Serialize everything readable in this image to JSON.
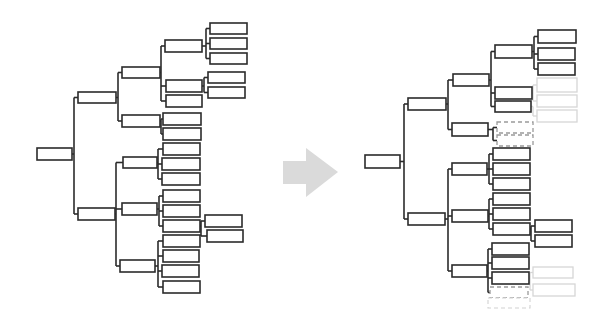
{
  "diagram": {
    "canvas": {
      "width": 614,
      "height": 332,
      "background": "#ffffff"
    },
    "styles": {
      "solid": {
        "stroke": "#2b2b2b",
        "width": 1.6,
        "dash": ""
      },
      "dashed": {
        "stroke": "#9a9a9a",
        "width": 1.3,
        "dash": "4 3"
      },
      "ghost": {
        "stroke": "#d6d6d6",
        "width": 1.3,
        "dash": ""
      },
      "ghost-dashed": {
        "stroke": "#d2d2d2",
        "width": 1.1,
        "dash": "4 3"
      }
    },
    "arrow": {
      "fill": "#dadada",
      "points": [
        [
          283,
          161
        ],
        [
          306,
          161
        ],
        [
          306,
          148
        ],
        [
          338,
          172
        ],
        [
          306,
          197
        ],
        [
          306,
          184
        ],
        [
          283,
          184
        ]
      ]
    },
    "trees": [
      {
        "id": "tree-before",
        "nodes": [
          {
            "id": "root",
            "x": 37,
            "y": 148,
            "w": 35,
            "h": 12,
            "style": "solid"
          },
          {
            "id": "u",
            "x": 78,
            "y": 92,
            "w": 38,
            "h": 11,
            "style": "solid"
          },
          {
            "id": "l",
            "x": 78,
            "y": 208,
            "w": 37,
            "h": 12,
            "style": "solid"
          },
          {
            "id": "a",
            "x": 122,
            "y": 67,
            "w": 38,
            "h": 11,
            "style": "solid"
          },
          {
            "id": "b",
            "x": 122,
            "y": 115,
            "w": 38,
            "h": 12,
            "style": "solid"
          },
          {
            "id": "c",
            "x": 123,
            "y": 157,
            "w": 34,
            "h": 11,
            "style": "solid"
          },
          {
            "id": "d",
            "x": 122,
            "y": 203,
            "w": 35,
            "h": 12,
            "style": "solid"
          },
          {
            "id": "e",
            "x": 120,
            "y": 260,
            "w": 35,
            "h": 12,
            "style": "solid"
          },
          {
            "id": "b1",
            "x": 165,
            "y": 40,
            "w": 37,
            "h": 12,
            "style": "solid"
          },
          {
            "id": "b2",
            "x": 166,
            "y": 80,
            "w": 36,
            "h": 12,
            "style": "solid"
          },
          {
            "id": "b3",
            "x": 166,
            "y": 95,
            "w": 36,
            "h": 12,
            "style": "solid"
          },
          {
            "id": "b4",
            "x": 163,
            "y": 113,
            "w": 38,
            "h": 12,
            "style": "solid"
          },
          {
            "id": "b5",
            "x": 163,
            "y": 128,
            "w": 38,
            "h": 12,
            "style": "solid"
          },
          {
            "id": "b6",
            "x": 163,
            "y": 143,
            "w": 37,
            "h": 12,
            "style": "solid"
          },
          {
            "id": "b7",
            "x": 162,
            "y": 158,
            "w": 38,
            "h": 12,
            "style": "solid"
          },
          {
            "id": "b8",
            "x": 162,
            "y": 173,
            "w": 38,
            "h": 12,
            "style": "solid"
          },
          {
            "id": "b9",
            "x": 163,
            "y": 190,
            "w": 37,
            "h": 12,
            "style": "solid"
          },
          {
            "id": "b10",
            "x": 163,
            "y": 205,
            "w": 37,
            "h": 12,
            "style": "solid"
          },
          {
            "id": "b11",
            "x": 163,
            "y": 220,
            "w": 37,
            "h": 12,
            "style": "solid"
          },
          {
            "id": "b12",
            "x": 163,
            "y": 235,
            "w": 37,
            "h": 12,
            "style": "solid"
          },
          {
            "id": "b13",
            "x": 163,
            "y": 250,
            "w": 36,
            "h": 12,
            "style": "solid"
          },
          {
            "id": "b14",
            "x": 162,
            "y": 265,
            "w": 37,
            "h": 12,
            "style": "solid"
          },
          {
            "id": "b15",
            "x": 163,
            "y": 281,
            "w": 37,
            "h": 12,
            "style": "solid"
          },
          {
            "id": "l1",
            "x": 210,
            "y": 23,
            "w": 37,
            "h": 11,
            "style": "solid"
          },
          {
            "id": "l2",
            "x": 210,
            "y": 38,
            "w": 37,
            "h": 11,
            "style": "solid"
          },
          {
            "id": "l3",
            "x": 210,
            "y": 53,
            "w": 37,
            "h": 11,
            "style": "solid"
          },
          {
            "id": "l4",
            "x": 208,
            "y": 72,
            "w": 37,
            "h": 11,
            "style": "solid"
          },
          {
            "id": "l5",
            "x": 208,
            "y": 87,
            "w": 37,
            "h": 11,
            "style": "solid"
          },
          {
            "id": "l6",
            "x": 205,
            "y": 215,
            "w": 37,
            "h": 12,
            "style": "solid"
          },
          {
            "id": "l7",
            "x": 207,
            "y": 230,
            "w": 36,
            "h": 12,
            "style": "solid"
          }
        ],
        "edges": [
          {
            "from": "root",
            "to": [
              "u",
              "l"
            ],
            "style": "solid"
          },
          {
            "from": "u",
            "to": [
              "a",
              "b"
            ],
            "style": "solid"
          },
          {
            "from": "l",
            "to": [
              "c",
              "d",
              "e"
            ],
            "style": "solid"
          },
          {
            "from": "a",
            "to": [
              "b1",
              "b2",
              "b3"
            ],
            "style": "solid"
          },
          {
            "from": "b",
            "to": [
              "b4",
              "b5"
            ],
            "style": "solid"
          },
          {
            "from": "c",
            "to": [
              "b6",
              "b7",
              "b8"
            ],
            "style": "solid"
          },
          {
            "from": "d",
            "to": [
              "b9",
              "b10",
              "b11"
            ],
            "style": "solid"
          },
          {
            "from": "e",
            "to": [
              "b12",
              "b13",
              "b14",
              "b15"
            ],
            "style": "solid"
          },
          {
            "from": "b1",
            "to": [
              "l1",
              "l2",
              "l3"
            ],
            "style": "solid"
          },
          {
            "from": "b2",
            "to": [
              "l4",
              "l5"
            ],
            "style": "solid"
          },
          {
            "from": "b11",
            "to": [
              "l6",
              "l7"
            ],
            "style": "solid"
          }
        ]
      },
      {
        "id": "tree-after",
        "nodes": [
          {
            "id": "root",
            "x": 365,
            "y": 155,
            "w": 35,
            "h": 13,
            "style": "solid"
          },
          {
            "id": "u",
            "x": 408,
            "y": 98,
            "w": 38,
            "h": 12,
            "style": "solid"
          },
          {
            "id": "l",
            "x": 408,
            "y": 213,
            "w": 37,
            "h": 12,
            "style": "solid"
          },
          {
            "id": "a",
            "x": 453,
            "y": 74,
            "w": 36,
            "h": 12,
            "style": "solid"
          },
          {
            "id": "b",
            "x": 452,
            "y": 123,
            "w": 36,
            "h": 13,
            "style": "solid"
          },
          {
            "id": "c",
            "x": 452,
            "y": 163,
            "w": 35,
            "h": 12,
            "style": "solid"
          },
          {
            "id": "d",
            "x": 452,
            "y": 210,
            "w": 36,
            "h": 12,
            "style": "solid"
          },
          {
            "id": "e",
            "x": 452,
            "y": 265,
            "w": 35,
            "h": 12,
            "style": "solid"
          },
          {
            "id": "b1",
            "x": 495,
            "y": 45,
            "w": 37,
            "h": 13,
            "style": "solid"
          },
          {
            "id": "b2",
            "x": 495,
            "y": 87,
            "w": 37,
            "h": 12,
            "style": "solid"
          },
          {
            "id": "b3",
            "x": 495,
            "y": 101,
            "w": 36,
            "h": 11,
            "style": "solid"
          },
          {
            "id": "d1",
            "x": 497,
            "y": 122,
            "w": 36,
            "h": 11,
            "style": "dashed"
          },
          {
            "id": "d2",
            "x": 497,
            "y": 135,
            "w": 36,
            "h": 11,
            "style": "dashed"
          },
          {
            "id": "b6",
            "x": 493,
            "y": 148,
            "w": 37,
            "h": 12,
            "style": "solid"
          },
          {
            "id": "b7",
            "x": 493,
            "y": 163,
            "w": 37,
            "h": 12,
            "style": "solid"
          },
          {
            "id": "b8",
            "x": 493,
            "y": 178,
            "w": 37,
            "h": 12,
            "style": "solid"
          },
          {
            "id": "b9",
            "x": 493,
            "y": 193,
            "w": 37,
            "h": 12,
            "style": "solid"
          },
          {
            "id": "b10",
            "x": 493,
            "y": 208,
            "w": 37,
            "h": 12,
            "style": "solid"
          },
          {
            "id": "b11",
            "x": 493,
            "y": 223,
            "w": 37,
            "h": 12,
            "style": "solid"
          },
          {
            "id": "b12",
            "x": 492,
            "y": 243,
            "w": 37,
            "h": 12,
            "style": "solid"
          },
          {
            "id": "b13",
            "x": 492,
            "y": 257,
            "w": 37,
            "h": 12,
            "style": "solid"
          },
          {
            "id": "b14",
            "x": 492,
            "y": 272,
            "w": 37,
            "h": 12,
            "style": "solid"
          },
          {
            "id": "d3",
            "x": 490,
            "y": 287,
            "w": 38,
            "h": 11,
            "style": "dashed"
          },
          {
            "id": "d4",
            "x": 488,
            "y": 298,
            "w": 42,
            "h": 10,
            "style": "ghost-dashed"
          },
          {
            "id": "l1",
            "x": 538,
            "y": 30,
            "w": 38,
            "h": 13,
            "style": "solid"
          },
          {
            "id": "l2",
            "x": 538,
            "y": 48,
            "w": 37,
            "h": 12,
            "style": "solid"
          },
          {
            "id": "l3",
            "x": 538,
            "y": 63,
            "w": 37,
            "h": 12,
            "style": "solid"
          },
          {
            "id": "g1",
            "x": 537,
            "y": 78,
            "w": 40,
            "h": 14,
            "style": "ghost"
          },
          {
            "id": "g2",
            "x": 537,
            "y": 95,
            "w": 40,
            "h": 12,
            "style": "ghost"
          },
          {
            "id": "g3",
            "x": 537,
            "y": 110,
            "w": 40,
            "h": 12,
            "style": "ghost"
          },
          {
            "id": "l6",
            "x": 535,
            "y": 220,
            "w": 37,
            "h": 12,
            "style": "solid"
          },
          {
            "id": "l7",
            "x": 535,
            "y": 235,
            "w": 37,
            "h": 12,
            "style": "solid"
          },
          {
            "id": "g4",
            "x": 533,
            "y": 267,
            "w": 40,
            "h": 11,
            "style": "ghost"
          },
          {
            "id": "g5",
            "x": 533,
            "y": 284,
            "w": 42,
            "h": 12,
            "style": "ghost"
          }
        ],
        "edges": [
          {
            "from": "root",
            "to": [
              "u",
              "l"
            ],
            "style": "solid"
          },
          {
            "from": "u",
            "to": [
              "a",
              "b"
            ],
            "style": "solid"
          },
          {
            "from": "l",
            "to": [
              "c",
              "d",
              "e"
            ],
            "style": "solid"
          },
          {
            "from": "a",
            "to": [
              "b1",
              "b2",
              "b3"
            ],
            "style": "solid"
          },
          {
            "from": "b",
            "to": [
              "d1",
              "d2"
            ],
            "style": "solid"
          },
          {
            "from": "c",
            "to": [
              "b6",
              "b7",
              "b8"
            ],
            "style": "solid"
          },
          {
            "from": "d",
            "to": [
              "b9",
              "b10",
              "b11"
            ],
            "style": "solid"
          },
          {
            "from": "e",
            "to": [
              "b12",
              "b13",
              "b14",
              "d3"
            ],
            "style": "solid"
          },
          {
            "from": "b1",
            "to": [
              "l1",
              "l2",
              "l3"
            ],
            "style": "solid"
          },
          {
            "from": "b11",
            "to": [
              "l6",
              "l7"
            ],
            "style": "solid"
          },
          {
            "from": "b2",
            "to": [
              "g1",
              "g2"
            ],
            "style": "ghost"
          },
          {
            "from": "b3",
            "to": [
              "g3"
            ],
            "style": "ghost"
          },
          {
            "from": "b14",
            "to": [
              "g4",
              "g5"
            ],
            "style": "ghost"
          }
        ]
      }
    ]
  }
}
